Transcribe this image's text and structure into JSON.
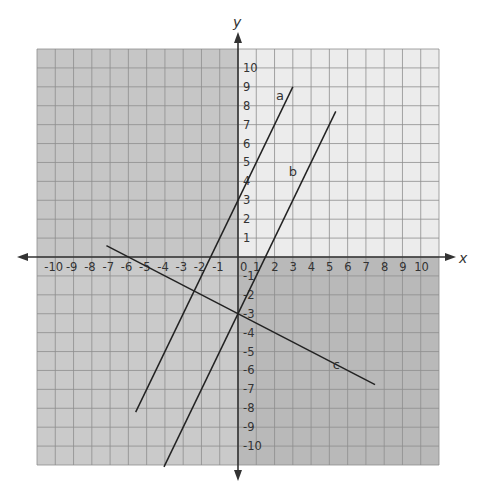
{
  "chart_data": {
    "type": "line",
    "title": "",
    "xlabel": "x",
    "ylabel": "y",
    "xlim": [
      -11,
      11
    ],
    "ylim": [
      -11,
      11
    ],
    "grid": true,
    "x_ticks": [
      -10,
      -9,
      -8,
      -7,
      -6,
      -5,
      -4,
      -3,
      -2,
      -1,
      0,
      1,
      2,
      3,
      4,
      5,
      6,
      7,
      8,
      9,
      10
    ],
    "y_ticks": [
      -10,
      -9,
      -8,
      -7,
      -6,
      -5,
      -4,
      -3,
      -2,
      -1,
      1,
      2,
      3,
      4,
      5,
      6,
      7,
      8,
      9,
      10
    ],
    "quadrant_colors": {
      "upper_left": "#c6c6c6",
      "upper_right": "#ececec",
      "lower_left": "#cacaca",
      "lower_right": "#b9b9b9"
    },
    "series": [
      {
        "name": "a",
        "equation": "y = 2x + 3",
        "x": [
          -5.6,
          3
        ],
        "y": [
          -8.2,
          9
        ],
        "label_pos": [
          2.3,
          8.5
        ]
      },
      {
        "name": "b",
        "equation": "y = 2x - 3",
        "x": [
          -4.05,
          5.35
        ],
        "y": [
          -11.1,
          7.7
        ],
        "label_pos": [
          3.0,
          4.5
        ]
      },
      {
        "name": "c",
        "equation": "y = -0.5x - 3",
        "x": [
          -7.2,
          7.5
        ],
        "y": [
          0.6,
          -6.75
        ],
        "label_pos": [
          5.4,
          -5.7
        ]
      }
    ],
    "legend": "none"
  }
}
